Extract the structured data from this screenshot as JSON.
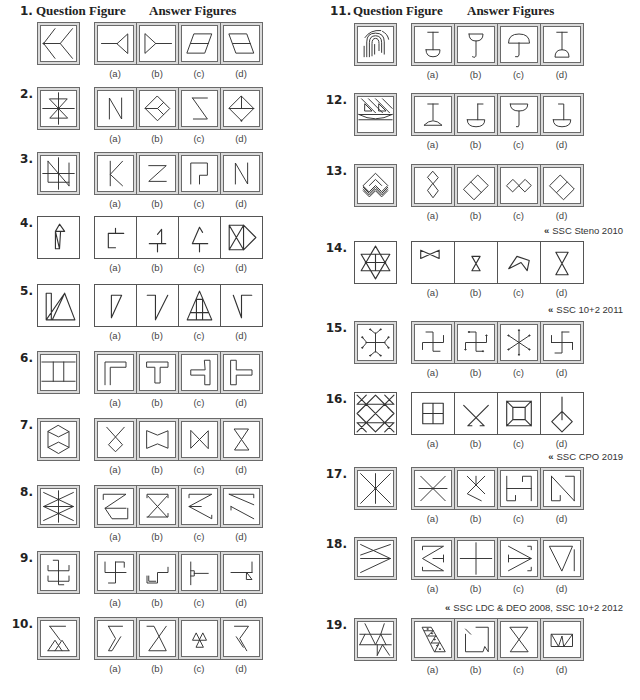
{
  "header": {
    "question_label": "Question Figure",
    "answer_label": "Answer Figures"
  },
  "option_labels": [
    "(a)",
    "(b)",
    "(c)",
    "(d)"
  ],
  "citation_marker": "«",
  "questions": [
    {
      "number": "1.",
      "question_figure": "M16 3L3 20L16 37M3 20H22M36 3L22 20L36 37M2.3 20a.7 .7 0 1 0 1.4 0a.7 .7 0 1 0-1.4 0",
      "answers": [
        "M4 20H22M22 20L34 9V31Z",
        "M6 9L18 20L6 31ZM18 20H36",
        "M14 9H34L26 31H6ZM10 20H30",
        "M6 9H26L34 31H14ZM10 20H30"
      ]
    },
    {
      "number": "2.",
      "question_figure": "M20 2V38M2 20H38M10 9H30L10 31H30ZM19.3 20a.7 .7 0 1 0 1.4 0a.7 .7 0 1 0-1.4 0",
      "answers": [
        "M13 32V8L27 32V8",
        "M20 6L34 20L20 34L6 20ZM6 20H20L27 27M20 20L27 13",
        "M12 8H29M12 8L29 32H13",
        "M20 6L34 20L20 34L6 20ZM6 20H34M20 6V20M19.3 34a.7 .7 0 1 0 1.4 0a.7 .7 0 1 0-1.4 0"
      ]
    },
    {
      "number": "3.",
      "question_figure": "M20 2V38M2 20H38M8 6L32 34M8 6V30H32M32 8V34",
      "answers": [
        "M14 6V34M28 6L14 21L28 34",
        "M10 11H30L10 29H30",
        "M10 32V8H29V22H20V32",
        "M13 32V8L27 32V8"
      ]
    },
    {
      "number": "4.",
      "question_figure": "M17 14L21 7L26 14H17ZM17 14V31H21L22 14M17 14L21 31",
      "answers": [
        "M13 16V30H20M13 16H28M20 11V16",
        "M12 26H28M20 26V34M24 26V12L20 17",
        "M20 10L13 26H28M20 10L23 15M20 26V34",
        "M8 8H22V32H8ZM8 8L22 32M22 8L8 32M22 8L34 20L22 32"
      ]
    },
    {
      "number": "5.",
      "question_figure": "M8 8H13V34H8ZM8 34H36L26 8L14 34M8 34L26 8",
      "answers": [
        "M16 10H26L16 32Z",
        "M10 10H18V34L30 10",
        "M20 6L8 34H32ZM11 27H29M17 14V34M23 14V34M17 14H23",
        "M12 10L20 32V10H30"
      ]
    },
    {
      "number": "6.",
      "question_figure": "M1 8H39M1 30H39M14 8V30M26 8V30",
      "answers": [
        "M8 34V8H32V14H14V34",
        "M8 8H32V14H23V32H17V14H8Z",
        "M26 6H32V34H26V23H10V17H26Z",
        "M8 6H14V17H32V23H14V34H8Z"
      ]
    },
    {
      "number": "7.",
      "question_figure": "M20 4L32 11V29L20 36L8 29V11ZM8 11L20 17L32 11M8 29L20 23L32 29",
      "answers": [
        "M10 6L28 26L20 34L12 26L30 6",
        "M8 10L20 15L32 10V30L20 25L8 30Z",
        "M10 10V30L30 10V30Z",
        "M12 8H28L12 32H28Z"
      ]
    },
    {
      "number": "8.",
      "question_figure": "M3 4L37 20L3 36M37 4L3 20L37 36M20 2V38M3 20H37M19.3 12a.7 .7 0 1 0 1.4 0a.7 .7 0 1 0-1.4 0M19.3 28a.7 .7 0 1 0 1.4 0a.7 .7 0 1 0-1.4 0",
      "answers": [
        "M6 12V6H32L8 22H32M8 22L16 34H34V22",
        "M8 10V6H32V10M9 8L31 32M31 8L9 32M8 32H32V28",
        "M8 10V6H34L8 20L34 34V30M8 20H22",
        "M6 6H34V10M6 6L34 18M8 20L34 34M8 20V24"
      ]
    },
    {
      "number": "9.",
      "question_figure": "M14 6H20V34H26M8 12V18H32V12M8 24V30H32V24",
      "answers": [
        "M8 8V20H32M20 8V32H12M20 8H30V14",
        "M8 24V32H20V20H32V14M10 24V30H18",
        "M10 8V34M10 18H14V24H10M14 21H30",
        "M8 20H26M32 8V20M26 20L32 28H26ZM26 20H32"
      ]
    },
    {
      "number": "10.",
      "question_figure": "M10 6H28M10 6L22 22M8 34H32M8 34L16 22L24 34M16 34L24 22L32 34",
      "answers": [
        "M12 6H28M12 6L20 20L12 34H16L26 18",
        "M8 6H16L30 34H10L30 6",
        "M20 22H12L16 14ZM20 22H28L24 14ZM20 22L16 30H24Z",
        "M12 6H28L18 20L26 34M14 18L22 30"
      ]
    },
    {
      "number": "11.",
      "question_figure": "M7 34V22M10 34V17Q10 7 20 7Q30 7 30 17V31M13 34V18Q13 10 20 10Q27 10 27 18V29M16 33V19Q16 13 20 13Q24 13 24 19V27M19 31V20M8 12Q14 3 26 4M28 5Q34 8 35 14",
      "answers": [
        "M14 6H26M20 6V26M12 26H28Q28 34 20 34Q12 34 12 26",
        "M12 8H28Q28 16 20 16Q12 16 12 8M20 16V32Q20 36 16 34",
        "M8 18Q8 8 20 8Q32 8 32 18ZM20 18V32Q20 35 16 34",
        "M14 6H26M20 6V26M12 34Q12 26 20 26Q28 26 28 34Z"
      ]
    },
    {
      "number": "12.",
      "question_figure": "M1 20H39M1 20Q20 30 39 20M1 26H39M4 2L20 18M12 2L28 18M20 2L36 18M28 2L39 13M8 16H16L8 8ZM24 16H32L24 8Z",
      "answers": [
        "M14 8H26M20 8V26M10 32Q20 22 30 32Z",
        "M22 8H28M22 8V26M10 26H30Q30 34 20 34Q10 34 10 26",
        "M10 8H30Q30 16 20 16Q10 16 10 8M20 16V32Q20 35 17 34",
        "M16 8H22V26M10 26H30Q30 34 20 34Q10 34 10 26"
      ]
    },
    {
      "number": "13.",
      "question_figure": "M6 20L20 6L34 20L27 27L20 20L13 27ZM13 20L20 13L27 20M6 22L13 29L20 22L27 29L34 22M6 24L13 31L20 24L27 31L34 24M6 26L13 33L20 26L27 33L34 26",
      "answers": [
        "M20 4L26 11L20 18L14 11ZM20 18L26 26L20 34L14 26Z",
        "M6 24L22 8L34 20L18 36ZM14 16L26 28",
        "M6 20L13 13L20 20L13 27ZM20 20L27 13L34 20L27 27Z",
        "M6 20L18 8L34 24L22 36ZM26 16L14 28"
      ],
      "citation": "SSC Steno 2010"
    },
    {
      "number": "14.",
      "question_figure": "M20 4L34 28H6ZM20 36L6 12H34ZM20 12V28M10 20H30",
      "answers": [
        "M8 8V16L26 8V16Z",
        "M16 14H24L16 28H24Z",
        "M10 26L18 14L30 18L28 28L22 20Z",
        "M14 10H26L14 32H26Z"
      ],
      "citation": "SSC 10+2 2011"
    },
    {
      "number": "15.",
      "question_figure": "M20 9V31M9 20H31M14 5L20 10L26 5M14 35L20 30L26 35M5 14L10 20L5 26M35 14L30 20L35 26M13.3 5a.7 .7 0 1 0 1.4 0a.7 .7 0 1 0-1.4 0M25.3 5a.7 .7 0 1 0 1.4 0a.7 .7 0 1 0-1.4 0M13.3 35a.7 .7 0 1 0 1.4 0a.7 .7 0 1 0-1.4 0M25.3 35a.7 .7 0 1 0 1.4 0a.7 .7 0 1 0-1.4 0M4.3 14a.7 .7 0 1 0 1.4 0a.7 .7 0 1 0-1.4 0M4.3 26a.7 .7 0 1 0 1.4 0a.7 .7 0 1 0-1.4 0M34.3 14a.7 .7 0 1 0 1.4 0a.7 .7 0 1 0-1.4 0M34.3 26a.7 .7 0 1 0 1.4 0a.7 .7 0 1 0-1.4 0",
      "answers": [
        "M12 8H20V30H28M8 28V20H32V12",
        "M12 8H20V30H28M8 28V20H32V12M11.3 8a.7 .7 0 1 0 1.4 0a.7 .7 0 1 0-1.4 0M27.3 30a.7 .7 0 1 0 1.4 0a.7 .7 0 1 0-1.4 0M7.3 28a.7 .7 0 1 0 1.4 0a.7 .7 0 1 0-1.4 0M31.3 12a.7 .7 0 1 0 1.4 0a.7 .7 0 1 0-1.4 0",
        "M20 6V34M8 12L32 28M32 12L8 28M19.3 6a.7 .7 0 1 0 1.4 0a.7 .7 0 1 0-1.4 0M19.3 34a.7 .7 0 1 0 1.4 0a.7 .7 0 1 0-1.4 0M7.3 12a.7 .7 0 1 0 1.4 0a.7 .7 0 1 0-1.4 0M31.3 28a.7 .7 0 1 0 1.4 0a.7 .7 0 1 0-1.4 0M31.3 12a.7 .7 0 1 0 1.4 0a.7 .7 0 1 0-1.4 0M7.3 28a.7 .7 0 1 0 1.4 0a.7 .7 0 1 0-1.4 0",
        "M20 8H28M20 8V32H12M8 20H32M8 20V12M32 20V28"
      ]
    },
    {
      "number": "16.",
      "question_figure": "M2 20L20 2L38 20L20 38ZM2 2L38 38M38 2L2 38M2 11L11 2M29 2L38 11M2 29L11 38M29 38L38 29M2 11H38M2 29H38",
      "answers": [
        "M10 10H30V30H10ZM20 10V30M10 20H30",
        "M8 12L28 32H24M32 12L12 32H16",
        "M8 8H32V32H8ZM14 14H26V26H14ZM8 8L14 14M32 8L26 14M8 32L14 26M32 32L26 26",
        "M20 4V26M20 18L30 28L20 38L10 28Z"
      ],
      "citation": "SSC CPO 2019"
    },
    {
      "number": "17.",
      "question_figure": "M3 3L37 37M37 3L3 37M20 3V37M19.3 20a.7 .7 0 1 0 1.4 0a.7 .7 0 1 0-1.4 0",
      "answers": [
        "M6 6L34 34M34 6L6 34M4 20H36M19.3 20a.7 .7 0 1 0 1.4 0a.7 .7 0 1 0-1.4 0",
        "M10 6L30 26M30 6L10 26L26 34M20 6V16",
        "M6 6V34H16V28M6 20H34M34 34V6H24V12",
        "M8 6V34H18V28M8 6L34 34M34 34V6H24"
      ]
    },
    {
      "number": "18.",
      "question_figure": "M3 4L37 20L3 36M37 4L3 16M3 20H37",
      "answers": [
        "M8 10V6H32L8 20L32 34H8V30M20 20H32M32 16V24",
        "M20 2V38M2 20H38",
        "M8 6L34 20L8 34M8 20H34M8 16V24M30 6H34V10M30 34H34V30",
        "M6 6H32L20 34ZM34 10V34"
      ],
      "citation": "SSC LDC & DEO 2008, SSC 10+2 2012"
    },
    {
      "number": "19.",
      "question_figure": "M2 14H38M2 26H38M8 2L14 14L20 26L26 14L30 2M2 26L8 14M26 14L32 26M22 38L28 26L36 38M22 26V38",
      "answers": [
        "M8 6H18L34 34H22ZM10 10H20M14 16H23M18 24H27M20 10L14 16M23 16L18 24M27 24L22 34M13.3 8a.7 .7 0 1 0 1.4 0a.7 .7 0 1 0-1.4 0M18.3 13a.7 .7 0 1 0 1.4 0a.7 .7 0 1 0-1.4 0M21.3 20a.7 .7 0 1 0 1.4 0a.7 .7 0 1 0-1.4 0M24.3 27a.7 .7 0 1 0 1.4 0a.7 .7 0 1 0-1.4 0M27.3 31a.7 .7 0 1 0 1.4 0a.7 .7 0 1 0-1.4 0",
        "M8 8L14 14M20 6H34V34L30 28L28 34H8V14",
        "M10 6H30L10 34H30Z",
        "M8 14H32V28H8ZM8 14L16 28L20 16L22 28L32 14"
      ]
    }
  ]
}
